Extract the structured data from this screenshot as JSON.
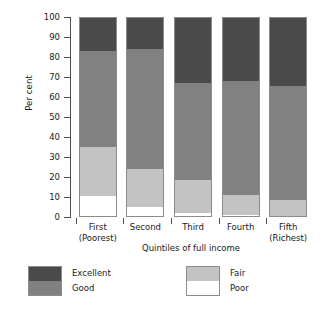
{
  "chart_data": {
    "type": "bar",
    "subtype": "stacked-bar-100",
    "title": "",
    "xlabel": "Quintiles of full income",
    "ylabel": "Per cent",
    "ylim": [
      0,
      100
    ],
    "yticks": [
      0,
      10,
      20,
      30,
      40,
      50,
      60,
      70,
      80,
      90,
      100
    ],
    "ytick_labels": [
      "0",
      "10",
      "20",
      "30",
      "40",
      "50",
      "60",
      "70",
      "80",
      "90",
      "100"
    ],
    "grid": false,
    "legend_position": "bottom",
    "categories": [
      "First\n(Poorest)",
      "Second",
      "Third",
      "Fourth",
      "Fifth\n(Richest)"
    ],
    "category_labels": [
      {
        "line1": "First",
        "line2": "(Poorest)"
      },
      {
        "line1": "Second",
        "line2": ""
      },
      {
        "line1": "Third",
        "line2": ""
      },
      {
        "line1": "Fourth",
        "line2": ""
      },
      {
        "line1": "Fifth",
        "line2": "(Richest)"
      }
    ],
    "series": [
      {
        "name": "Excellent",
        "color": "#4a4a4a",
        "values": [
          16.5,
          15.5,
          33.0,
          32.0,
          34.5
        ]
      },
      {
        "name": "Good",
        "color": "#818181",
        "values": [
          48.5,
          61.0,
          49.0,
          57.5,
          57.5
        ]
      },
      {
        "name": "Fair",
        "color": "#c3c3c3",
        "values": [
          25.0,
          19.0,
          16.5,
          10.0,
          8.0
        ]
      },
      {
        "name": "Poor",
        "color": "#ffffff",
        "values": [
          10.0,
          4.5,
          1.5,
          0.5,
          0.0
        ]
      }
    ],
    "stack_tops": {
      "poor": [
        10.0,
        4.5,
        1.5,
        0.5,
        0.0
      ],
      "fair": [
        35.0,
        23.5,
        18.0,
        10.5,
        8.0
      ],
      "good": [
        83.5,
        84.5,
        67.0,
        68.0,
        65.5
      ],
      "excellent": [
        100.0,
        100.0,
        100.0,
        100.0,
        100.0
      ]
    }
  },
  "legend": {
    "entries": [
      {
        "label": "Excellent",
        "color": "#4a4a4a"
      },
      {
        "label": "Good",
        "color": "#818181"
      },
      {
        "label": "Fair",
        "color": "#c3c3c3"
      },
      {
        "label": "Poor",
        "color": "#ffffff"
      }
    ]
  },
  "colors": {
    "excellent": "#4a4a4a",
    "good": "#818181",
    "fair": "#c3c3c3",
    "poor": "#ffffff",
    "axis": "#4d4d4d",
    "bar_outline": "#8c8c8c",
    "background": "#ffffff"
  }
}
